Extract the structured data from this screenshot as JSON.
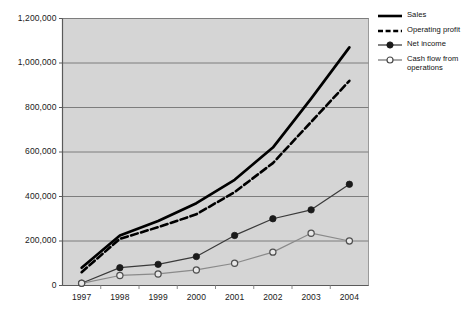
{
  "chart_data": {
    "type": "line",
    "title": "",
    "xlabel": "",
    "ylabel": "",
    "categories": [
      "1997",
      "1998",
      "1999",
      "2000",
      "2001",
      "2002",
      "2003",
      "2004"
    ],
    "x": [
      1997,
      1998,
      1999,
      2000,
      2001,
      2002,
      2003,
      2004
    ],
    "ylim": [
      0,
      1200000
    ],
    "ytick_values": [
      0,
      200000,
      400000,
      600000,
      800000,
      1000000,
      1200000
    ],
    "ytick_labels": [
      "0",
      "200,000",
      "400,000",
      "600,000",
      "800,000",
      "1,000,000",
      "1,200,000"
    ],
    "grid": "horizontal",
    "legend_position": "top-right-outside",
    "plot_background": "#d5d5d5",
    "figure_background": "#ffffff",
    "series": [
      {
        "name": "Sales",
        "style": "solid-thick",
        "color": "#000000",
        "marker": "none",
        "values": [
          80000,
          225000,
          290000,
          370000,
          475000,
          620000,
          840000,
          1070000
        ]
      },
      {
        "name": "Operating profit",
        "style": "dashed-thick",
        "color": "#000000",
        "marker": "none",
        "values": [
          60000,
          210000,
          262000,
          320000,
          420000,
          550000,
          735000,
          920000
        ]
      },
      {
        "name": "Net income",
        "style": "solid-thin",
        "color": "#3a3a3a",
        "marker": "filled-circle",
        "values": [
          10000,
          80000,
          95000,
          130000,
          225000,
          300000,
          340000,
          455000
        ]
      },
      {
        "name": "Cash flow from operations",
        "style": "solid-thin",
        "color": "#8a8a8a",
        "marker": "open-circle",
        "values": [
          10000,
          45000,
          52000,
          70000,
          100000,
          150000,
          235000,
          200000
        ]
      }
    ]
  },
  "legend": {
    "items": [
      {
        "label": "Sales",
        "swatch": "solid-thick-line-swatch"
      },
      {
        "label": "Operating profit",
        "swatch": "dashed-thick-line-swatch"
      },
      {
        "label": "Net income",
        "swatch": "filled-marker-line-swatch"
      },
      {
        "label": "Cash flow from operations",
        "swatch": "open-marker-line-swatch"
      }
    ]
  }
}
